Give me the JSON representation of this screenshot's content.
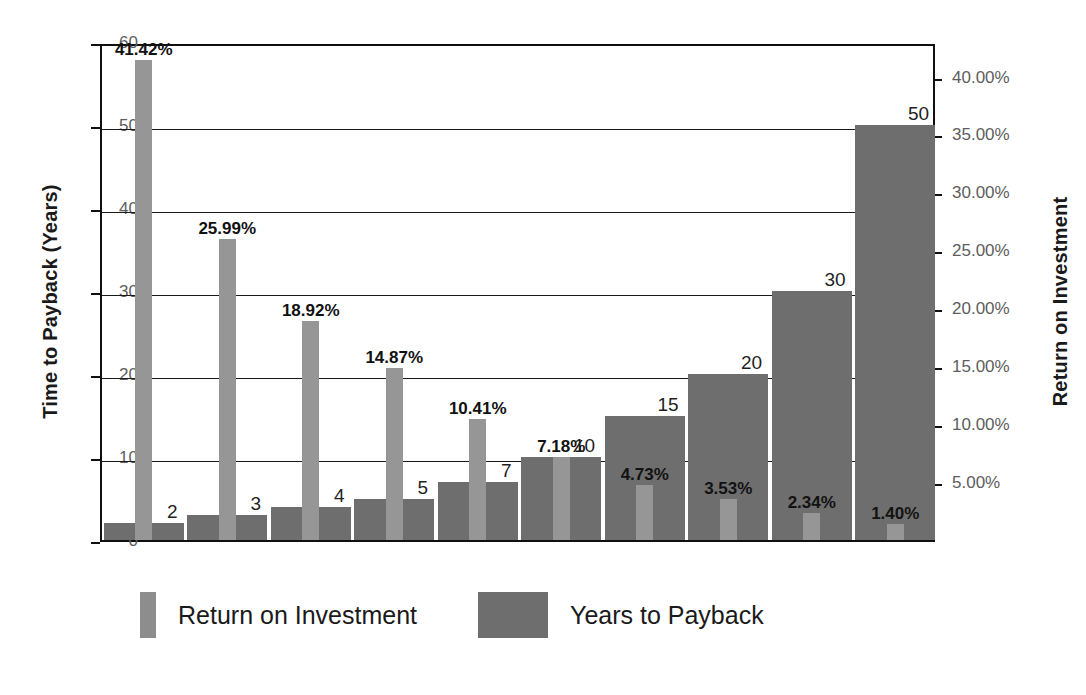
{
  "chart_data": {
    "type": "bar",
    "title": "",
    "subtitle": "",
    "categories": [
      "1",
      "2",
      "3",
      "4",
      "5",
      "6",
      "7",
      "8",
      "9",
      "10"
    ],
    "series": [
      {
        "name": "Return on Investment",
        "axis": "right",
        "color": "#969696",
        "values": [
          41.42,
          25.99,
          18.92,
          14.87,
          10.41,
          7.18,
          4.73,
          3.53,
          2.34,
          1.4
        ],
        "labels": [
          "41.42%",
          "25.99%",
          "18.92%",
          "14.87%",
          "10.41%",
          "7.18%",
          "4.73%",
          "3.53%",
          "2.34%",
          "1.40%"
        ]
      },
      {
        "name": "Years to Payback",
        "axis": "left",
        "color": "#6e6e6e",
        "values": [
          2,
          3,
          4,
          5,
          7,
          10,
          15,
          20,
          30,
          50
        ],
        "labels": [
          "2",
          "3",
          "4",
          "5",
          "7",
          "10",
          "15",
          "20",
          "30",
          "50"
        ]
      }
    ],
    "xlabel": "",
    "ylabel": "Time to Payback (Years)",
    "y2label": "Return on Investment",
    "ylim": [
      0,
      60
    ],
    "y2lim": [
      0,
      42.98
    ],
    "yticks": [
      0,
      10,
      20,
      30,
      40,
      50,
      60
    ],
    "yticklabels": [
      "0",
      "10",
      "20",
      "30",
      "40",
      "50",
      "60"
    ],
    "y2ticks": [
      5,
      10,
      15,
      20,
      25,
      30,
      35,
      40
    ],
    "y2ticklabels": [
      "5.00%",
      "10.00%",
      "15.00%",
      "20.00%",
      "25.00%",
      "30.00%",
      "35.00%",
      "40.00%"
    ],
    "xticklabels": [],
    "grid": true,
    "legend_position": "bottom"
  },
  "axes": {
    "left_title": "Time to Payback (Years)",
    "right_title": "Return on Investment"
  },
  "legend": {
    "entries": [
      {
        "label": "Return on Investment",
        "swatch": "roi"
      },
      {
        "label": "Years to Payback",
        "swatch": "payback"
      }
    ]
  }
}
